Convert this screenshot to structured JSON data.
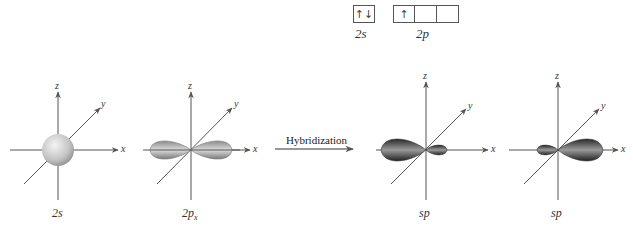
{
  "electron_config": {
    "s_subshell": {
      "label": "2s",
      "boxes": [
        "↑↓"
      ]
    },
    "p_subshell": {
      "label": "2p",
      "boxes": [
        "↑",
        "",
        ""
      ]
    }
  },
  "arrow_label": "Hybridization",
  "axes": {
    "x": "x",
    "y": "y",
    "z": "z"
  },
  "panels": [
    {
      "label": "2s",
      "shape": "sphere"
    },
    {
      "label": "2px",
      "label_main": "2p",
      "label_sub": "x",
      "shape": "dumbbell"
    },
    {
      "label": "sp",
      "shape": "sp-hybrid-left"
    },
    {
      "label": "sp",
      "shape": "sp-hybrid-right"
    }
  ],
  "colors": {
    "axis": "#555555",
    "s_orbital": "#c8c8c8",
    "p_orbital": "#a8a8a8",
    "sp_orbital": "#555555"
  }
}
